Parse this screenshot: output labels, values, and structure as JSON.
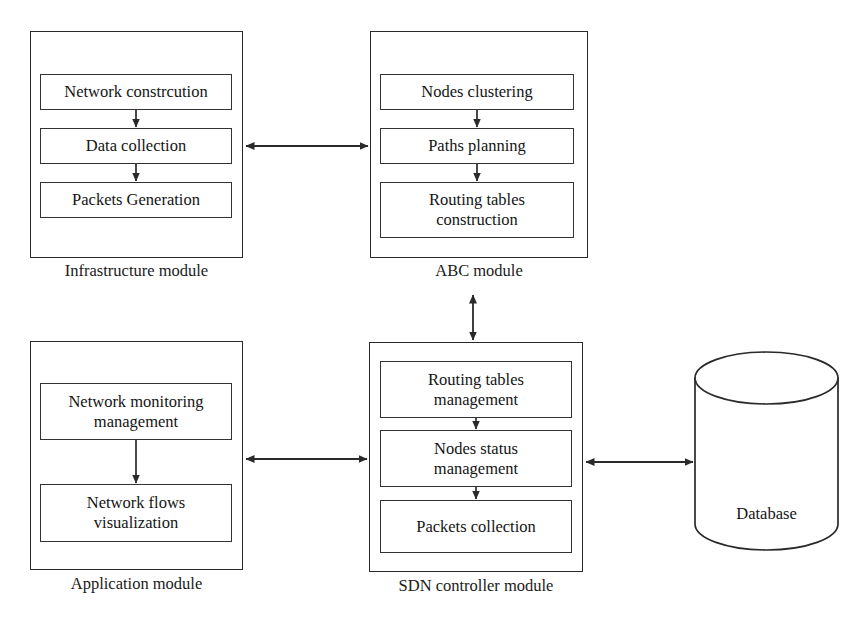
{
  "diagram": {
    "background_color": "#ffffff",
    "line_color": "#2a2a2a",
    "text_color": "#141414"
  },
  "modules": [
    {
      "id": "infrastructure",
      "label": "Infrastructure module",
      "steps": [
        {
          "lines": [
            "Network constrcution"
          ]
        },
        {
          "lines": [
            "Data collection"
          ]
        },
        {
          "lines": [
            "Packets Generation"
          ]
        }
      ]
    },
    {
      "id": "abc",
      "label": "ABC module",
      "steps": [
        {
          "lines": [
            "Nodes clustering"
          ]
        },
        {
          "lines": [
            "Paths planning"
          ]
        },
        {
          "lines": [
            "Routing tables",
            "construction"
          ]
        }
      ]
    },
    {
      "id": "application",
      "label": "Application module",
      "steps": [
        {
          "lines": [
            "Network monitoring",
            "management"
          ]
        },
        {
          "lines": [
            "Network flows",
            "visualization"
          ]
        }
      ]
    },
    {
      "id": "sdn",
      "label": "SDN controller module",
      "steps": [
        {
          "lines": [
            "Routing tables",
            "management"
          ]
        },
        {
          "lines": [
            "Nodes status",
            "management"
          ]
        },
        {
          "lines": [
            "Packets collection"
          ]
        }
      ]
    }
  ],
  "database": {
    "label": "Database"
  },
  "connectors": [
    {
      "id": "infrastructure-abc",
      "from": "infrastructure",
      "to": "abc",
      "direction": "bidirectional",
      "orientation": "horizontal"
    },
    {
      "id": "abc-sdn",
      "from": "abc",
      "to": "sdn",
      "direction": "bidirectional",
      "orientation": "vertical"
    },
    {
      "id": "application-sdn",
      "from": "application",
      "to": "sdn",
      "direction": "bidirectional",
      "orientation": "horizontal"
    },
    {
      "id": "sdn-database",
      "from": "sdn",
      "to": "database",
      "direction": "bidirectional",
      "orientation": "horizontal"
    }
  ],
  "internal_flows": [
    {
      "module": "infrastructure",
      "direction": "downward"
    },
    {
      "module": "abc",
      "direction": "downward"
    },
    {
      "module": "application",
      "direction": "downward"
    },
    {
      "module": "sdn",
      "direction": "downward"
    }
  ]
}
